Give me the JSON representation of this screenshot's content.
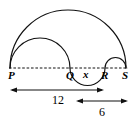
{
  "figure": {
    "baseline": {
      "name": "dashed-baseline",
      "y": 68,
      "x_start": 9,
      "x_end": 128
    },
    "points": [
      {
        "id": "P",
        "label": "P",
        "x": 10,
        "label_x": 8,
        "label_y": 79
      },
      {
        "id": "Q",
        "label": "Q",
        "x": 70,
        "label_x": 66,
        "label_y": 79
      },
      {
        "id": "R",
        "label": "R",
        "x": 105,
        "label_x": 101,
        "label_y": 79
      },
      {
        "id": "S",
        "label": "S",
        "x": 126,
        "label_x": 122,
        "label_y": 79
      }
    ],
    "unknown": {
      "name": "x",
      "label": "x",
      "label_x": 85,
      "label_y": 78
    },
    "arcs": [
      {
        "name": "arc-P-S-outer",
        "from": "P",
        "to": "S",
        "side": "above",
        "apex_y": 10
      },
      {
        "name": "arc-P-Q-middle",
        "from": "P",
        "to": "Q",
        "side": "above",
        "apex_y": 37
      },
      {
        "name": "arc-Q-R-lower",
        "from": "Q",
        "to": "R",
        "side": "below",
        "apex_y": 85
      },
      {
        "name": "arc-R-S-small",
        "from": "R",
        "to": "S",
        "side": "above",
        "apex_y": 57
      }
    ],
    "dimensions": [
      {
        "name": "dimension-12",
        "label": "12",
        "from": "P",
        "to": "R",
        "x_start": 10,
        "x_end": 104,
        "y": 90,
        "label_x": 57,
        "label_y": 104
      },
      {
        "name": "dimension-6",
        "label": "6",
        "from": "x",
        "to": "S",
        "x_start": 76,
        "x_end": 128,
        "y": 101,
        "label_x": 102,
        "label_y": 116
      }
    ],
    "colors": {
      "stroke": "#111111",
      "background": "#ffffff"
    }
  }
}
